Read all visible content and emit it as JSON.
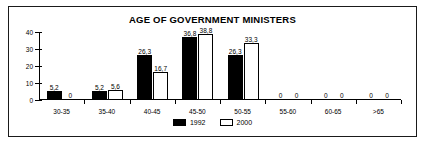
{
  "chart_data": {
    "type": "bar",
    "title": "AGE OF GOVERNMENT MINISTERS",
    "xlabel": "",
    "ylabel": "",
    "ylim": [
      0,
      40
    ],
    "yticks": [
      "0",
      "10",
      "20",
      "30",
      "40"
    ],
    "grid": false,
    "legend_position": "bottom",
    "decimal_separator": ",",
    "categories": [
      "30-35",
      "35-40",
      "40-45",
      "45-50",
      "50-55",
      "55-60",
      "60-65",
      ">65"
    ],
    "series": [
      {
        "name": "1992",
        "color": "#000000",
        "values": [
          5.2,
          5.2,
          26.3,
          36.8,
          26.3,
          0,
          0,
          0
        ],
        "labels": [
          "5,2",
          "5,2",
          "26,3",
          "36,8",
          "26,3",
          "0",
          "0",
          "0"
        ]
      },
      {
        "name": "2000",
        "color": "#ffffff",
        "values": [
          0,
          5.6,
          16.7,
          38.8,
          33.3,
          0,
          0,
          0
        ],
        "labels": [
          "0",
          "5,6",
          "16,7",
          "38,8",
          "33,3",
          "0",
          "0",
          "0"
        ]
      }
    ]
  },
  "legend": {
    "items": [
      {
        "label": "1992"
      },
      {
        "label": "2000"
      }
    ]
  }
}
